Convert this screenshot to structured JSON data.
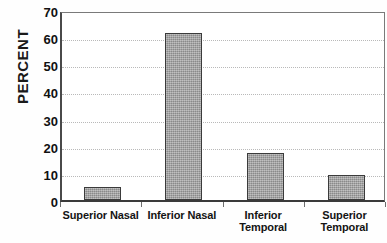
{
  "chart_data": {
    "type": "bar",
    "title": "",
    "xlabel": "",
    "ylabel": "PERCENT",
    "categories": [
      "Superior Nasal",
      "Inferior Nasal",
      "Inferior Temporal",
      "Superior Temporal"
    ],
    "category_lines": [
      [
        "Superior Nasal"
      ],
      [
        "Inferior Nasal"
      ],
      [
        "Inferior",
        "Temporal"
      ],
      [
        "Superior",
        "Temporal"
      ]
    ],
    "values": [
      4.8,
      61.5,
      17.3,
      9.3
    ],
    "ylim": [
      0,
      70
    ],
    "ytick_step": 10,
    "yticks": [
      "0",
      "10",
      "20",
      "30",
      "40",
      "50",
      "60",
      "70"
    ],
    "grid": "horizontal-dotted",
    "legend": "none",
    "bar_color": "#9d9d9d",
    "bar_border_color": "#3b3b3b",
    "gridline_color": "#b9b9b9",
    "axis_color": "#3a3a3a",
    "text_color": "#141414"
  }
}
